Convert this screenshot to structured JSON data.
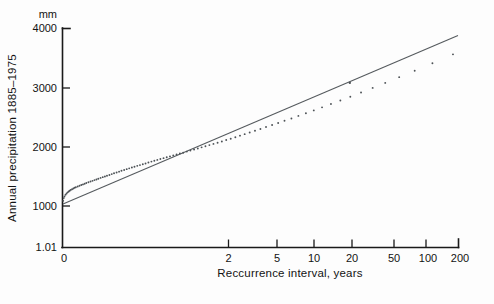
{
  "chart_data": {
    "type": "scatter",
    "title": "",
    "xlabel": "Reccurrence interval, years",
    "ylabel": "Annual precipitation 1885–1975",
    "yunit": "mm",
    "xscale": "gumbel-log",
    "yscale": "linear",
    "grid": false,
    "legend": "none",
    "xticks": [
      "0",
      "2",
      "5",
      "10",
      "20",
      "50",
      "100",
      "200"
    ],
    "xtick_values": [
      1.01,
      2,
      5,
      10,
      20,
      50,
      100,
      200
    ],
    "yticks": [
      "1.01",
      "1000",
      "2000",
      "3000",
      "4000"
    ],
    "ytick_values": [
      0,
      1000,
      2000,
      3000,
      4000
    ],
    "ylim": [
      0,
      4000
    ],
    "xlim": [
      1.01,
      200
    ],
    "fit_line": {
      "label": "",
      "x_start": 1.01,
      "y_start": 1040,
      "x_end": 200,
      "y_end": 3880
    },
    "series": [
      {
        "name": "Annual precipitation",
        "x": [
          1.012,
          1.02,
          1.03,
          1.045,
          1.06,
          1.075,
          1.09,
          1.105,
          1.12,
          1.14,
          1.16,
          1.18,
          1.2,
          1.23,
          1.26,
          1.29,
          1.32,
          1.35,
          1.38,
          1.42,
          1.46,
          1.5,
          1.54,
          1.58,
          1.62,
          1.67,
          1.72,
          1.77,
          1.82,
          1.88,
          1.94,
          2.0,
          2.07,
          2.14,
          2.21,
          2.29,
          2.37,
          2.45,
          2.54,
          2.63,
          2.73,
          2.83,
          2.94,
          3.05,
          3.17,
          3.3,
          3.43,
          3.57,
          3.72,
          3.88,
          4.05,
          4.23,
          4.42,
          4.62,
          4.83,
          5.05,
          5.3,
          5.56,
          5.84,
          6.14,
          6.46,
          6.8,
          7.17,
          7.57,
          8.0,
          8.47,
          8.98,
          9.54,
          10.15,
          10.8,
          11.5,
          12.3,
          13.2,
          14.2,
          15.3,
          16.6,
          18.0,
          19.6,
          21.5,
          23.6,
          26.1,
          29.0,
          32.4,
          36.5,
          41.4,
          47.3,
          54.6,
          63.8,
          75.5,
          91.0,
          112.0,
          142.0,
          187.0
        ],
        "y": [
          850,
          900,
          930,
          960,
          985,
          1005,
          1020,
          1035,
          1050,
          1062,
          1075,
          1088,
          1098,
          1112,
          1125,
          1138,
          1150,
          1162,
          1175,
          1190,
          1202,
          1215,
          1228,
          1240,
          1252,
          1268,
          1282,
          1295,
          1308,
          1322,
          1338,
          1352,
          1368,
          1382,
          1398,
          1412,
          1428,
          1442,
          1458,
          1472,
          1488,
          1502,
          1518,
          1532,
          1548,
          1565,
          1580,
          1596,
          1612,
          1628,
          1645,
          1660,
          1678,
          1695,
          1712,
          1728,
          1748,
          1766,
          1785,
          1805,
          1825,
          1845,
          1866,
          1888,
          1910,
          1933,
          1958,
          1983,
          2010,
          2038,
          2066,
          2096,
          2128,
          2160,
          2195,
          2232,
          2270,
          2310,
          2352,
          2398,
          2446,
          2498,
          2554,
          2614,
          2678,
          2748,
          2824,
          2908,
          3000,
          3104,
          3222,
          3358,
          3520
        ],
        "marker": "dot",
        "color": "#4d5256"
      }
    ],
    "annotations": [
      {
        "name": "outlier-point",
        "x": 47.0,
        "y": 3000,
        "note": "single point plotting above the fitted line"
      }
    ]
  },
  "axes": {
    "y_unit_label": "mm",
    "y_axis_title": "Annual precipitation 1885–1975",
    "x_axis_title": "Reccurrence interval, years"
  },
  "colors": {
    "ink": "#131313",
    "line": "#555a5e",
    "points": "#4d5256",
    "background": "#fdfdfd"
  }
}
